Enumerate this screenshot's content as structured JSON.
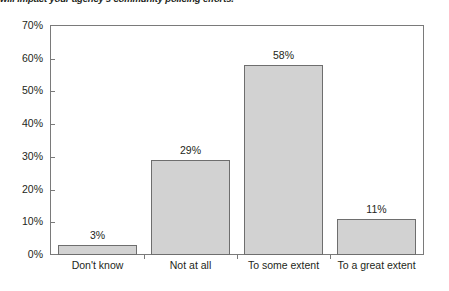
{
  "caption": {
    "text": "will impact your agency's community policing efforts."
  },
  "chart_data": {
    "type": "bar",
    "title": "",
    "subtitle": "",
    "xlabel": "",
    "ylabel": "",
    "categories": [
      "Don't know",
      "Not at all",
      "To some extent",
      "To a great extent"
    ],
    "values": [
      3,
      29,
      58,
      11
    ],
    "data_labels": [
      "3%",
      "29%",
      "58%",
      "11%"
    ],
    "ylim": [
      0,
      70
    ],
    "ytick_values": [
      0,
      10,
      20,
      30,
      40,
      50,
      60,
      70
    ],
    "ytick_labels": [
      "0%",
      "10%",
      "20%",
      "30%",
      "40%",
      "50%",
      "60%",
      "70%"
    ],
    "grid": false,
    "legend": false,
    "legend_position": "none",
    "bar_fill_color": "#d2d2d2",
    "bar_border_color": "#6e6e6e",
    "axis_color": "#7a7a7a",
    "text_color": "#231f20",
    "background_color": "#ffffff"
  }
}
